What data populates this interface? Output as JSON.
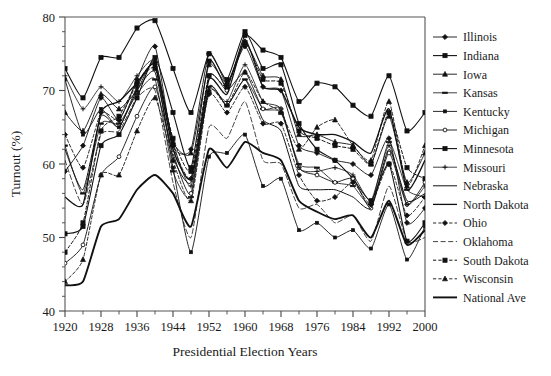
{
  "chart_data": {
    "type": "line",
    "title": "",
    "xlabel": "Presidential Election Years",
    "ylabel": "Turnout (%)",
    "xlim": [
      1920,
      2000
    ],
    "ylim": [
      40,
      80
    ],
    "grid": false,
    "legend_position": "right",
    "x": [
      1920,
      1924,
      1928,
      1932,
      1936,
      1940,
      1944,
      1948,
      1952,
      1956,
      1960,
      1964,
      1968,
      1972,
      1976,
      1980,
      1984,
      1988,
      1992,
      1996,
      2000
    ],
    "x_tick_labels": [
      "1920",
      "1928",
      "1936",
      "1944",
      "1952",
      "1960",
      "1968",
      "1976",
      "1984",
      "1992",
      "2000"
    ],
    "x_tick_values": [
      1920,
      1928,
      1936,
      1944,
      1952,
      1960,
      1968,
      1976,
      1984,
      1992,
      2000
    ],
    "y_tick_labels": [
      "40",
      "50",
      "60",
      "70",
      "80"
    ],
    "y_tick_values": [
      40,
      50,
      60,
      70,
      80
    ],
    "series": [
      {
        "name": "Illinois",
        "marker": "diamond",
        "dash": "none",
        "width": 0.9,
        "values": [
          59.0,
          62.5,
          69.0,
          66.0,
          71.5,
          76.0,
          62.5,
          62.0,
          75.0,
          71.0,
          76.0,
          70.5,
          70.0,
          62.5,
          61.5,
          60.5,
          60.0,
          58.5,
          63.5,
          52.0,
          54.0
        ]
      },
      {
        "name": "Indiana",
        "marker": "square",
        "dash": "none",
        "width": 1.1,
        "values": [
          73.0,
          69.0,
          74.5,
          74.5,
          78.5,
          79.5,
          73.0,
          67.0,
          75.0,
          71.5,
          78.0,
          73.0,
          73.5,
          65.5,
          62.0,
          60.5,
          58.0,
          55.0,
          60.0,
          49.5,
          52.0
        ]
      },
      {
        "name": "Iowa",
        "marker": "triangle",
        "dash": "none",
        "width": 0.9,
        "values": [
          67.0,
          64.5,
          69.5,
          67.5,
          70.0,
          74.0,
          63.0,
          61.5,
          73.5,
          71.0,
          76.5,
          72.0,
          71.5,
          64.0,
          64.0,
          63.0,
          62.5,
          60.0,
          66.5,
          57.5,
          61.5
        ]
      },
      {
        "name": "Kansas",
        "marker": "dash",
        "dash": "none",
        "width": 0.8,
        "values": [
          62.5,
          56.0,
          65.5,
          65.5,
          69.5,
          71.5,
          59.0,
          55.5,
          70.5,
          68.0,
          71.5,
          67.5,
          67.0,
          60.0,
          59.5,
          57.5,
          57.0,
          54.5,
          63.0,
          56.5,
          55.5
        ]
      },
      {
        "name": "Kentucky",
        "marker": "small-square",
        "dash": "none",
        "width": 0.9,
        "values": [
          71.5,
          64.0,
          67.5,
          65.0,
          70.5,
          73.5,
          59.5,
          48.0,
          61.0,
          61.5,
          64.0,
          57.0,
          58.0,
          51.0,
          52.0,
          50.0,
          51.0,
          48.5,
          54.5,
          47.0,
          51.5
        ]
      },
      {
        "name": "Michigan",
        "marker": "circle",
        "dash": "none",
        "width": 0.9,
        "values": [
          46.5,
          49.0,
          58.5,
          61.0,
          66.5,
          70.5,
          61.5,
          56.0,
          72.0,
          70.0,
          72.5,
          67.5,
          67.5,
          59.5,
          58.5,
          57.5,
          58.0,
          54.0,
          61.5,
          54.5,
          57.5
        ]
      },
      {
        "name": "Minnesota",
        "marker": "square",
        "dash": "none",
        "width": 1.1,
        "values": [
          50.5,
          51.5,
          62.5,
          64.0,
          69.0,
          74.5,
          67.0,
          59.5,
          74.0,
          70.5,
          77.5,
          75.5,
          74.5,
          68.5,
          71.0,
          70.5,
          68.0,
          66.5,
          72.0,
          64.5,
          67.0
        ]
      },
      {
        "name": "Missouri",
        "marker": "plus",
        "dash": "none",
        "width": 0.8,
        "values": [
          72.0,
          67.5,
          70.5,
          68.5,
          72.0,
          74.0,
          63.0,
          57.0,
          70.0,
          68.5,
          73.5,
          68.5,
          67.5,
          59.5,
          59.0,
          59.5,
          58.5,
          55.0,
          62.5,
          54.5,
          57.0
        ]
      },
      {
        "name": "Nebraska",
        "marker": "none",
        "dash": "none",
        "width": 1.0,
        "values": [
          62.0,
          56.5,
          66.5,
          65.0,
          70.0,
          72.5,
          61.0,
          57.5,
          70.5,
          68.0,
          71.5,
          66.0,
          64.5,
          57.0,
          56.5,
          56.5,
          55.5,
          54.0,
          62.0,
          55.0,
          56.0
        ]
      },
      {
        "name": "North Dakota",
        "marker": "none",
        "dash": "none",
        "width": 1.3,
        "values": [
          55.5,
          54.5,
          67.0,
          68.5,
          71.0,
          73.5,
          62.0,
          58.0,
          71.5,
          69.5,
          77.0,
          70.5,
          70.0,
          65.0,
          64.0,
          64.0,
          63.0,
          61.5,
          67.5,
          56.5,
          60.5
        ]
      },
      {
        "name": "Ohio",
        "marker": "diamond",
        "dash": "dot",
        "width": 0.9,
        "values": [
          64.0,
          59.5,
          67.0,
          66.0,
          71.0,
          73.5,
          62.5,
          58.0,
          69.5,
          67.0,
          70.5,
          65.5,
          65.5,
          58.5,
          55.0,
          55.5,
          57.5,
          54.5,
          60.0,
          53.0,
          55.5
        ]
      },
      {
        "name": "Oklahoma",
        "marker": "none",
        "dash": "dash",
        "width": 0.8,
        "values": [
          60.5,
          54.5,
          64.0,
          64.5,
          69.0,
          70.0,
          57.5,
          50.0,
          65.0,
          63.5,
          68.5,
          60.5,
          60.0,
          54.0,
          54.5,
          52.0,
          53.0,
          49.5,
          57.0,
          49.5,
          50.0
        ]
      },
      {
        "name": "South Dakota",
        "marker": "square",
        "dash": "dot",
        "width": 1.0,
        "values": [
          48.0,
          52.0,
          64.5,
          66.5,
          71.0,
          73.0,
          63.5,
          59.0,
          72.0,
          70.5,
          76.5,
          71.5,
          71.0,
          64.5,
          63.5,
          62.5,
          62.0,
          60.0,
          67.0,
          59.5,
          58.0
        ]
      },
      {
        "name": "Wisconsin",
        "marker": "triangle",
        "dash": "dot",
        "width": 0.9,
        "values": [
          44.0,
          47.0,
          58.5,
          58.5,
          64.5,
          69.0,
          60.5,
          55.0,
          70.0,
          68.0,
          72.5,
          68.5,
          67.0,
          62.0,
          65.0,
          66.0,
          62.5,
          60.5,
          68.5,
          57.0,
          62.5
        ]
      },
      {
        "name": "National Ave",
        "marker": "none",
        "dash": "none",
        "width": 1.9,
        "values": [
          43.5,
          44.0,
          51.5,
          52.5,
          56.5,
          58.5,
          56.0,
          51.5,
          62.0,
          59.5,
          63.0,
          61.5,
          60.5,
          55.0,
          53.5,
          52.5,
          53.0,
          50.0,
          55.0,
          49.0,
          51.0
        ]
      }
    ]
  }
}
